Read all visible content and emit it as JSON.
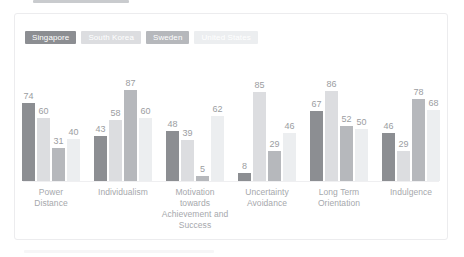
{
  "card": {
    "background_color": "#ffffff",
    "border_color": "#ececee"
  },
  "legend": {
    "position": "top-left",
    "items": [
      {
        "label": "Singapore",
        "color": "#8c8e92"
      },
      {
        "label": "South Korea",
        "color": "#dcdde0"
      },
      {
        "label": "Sweden",
        "color": "#b6b8bc"
      },
      {
        "label": "United States",
        "color": "#eceef0"
      }
    ]
  },
  "axis": {
    "baseline_color": "#efeff1",
    "label_color": "#a6a8ac",
    "value_label_color": "#9b9da1"
  },
  "chart_data": {
    "type": "bar",
    "title": "",
    "subtitle": "",
    "xlabel": "",
    "ylabel": "",
    "ylim": [
      0,
      100
    ],
    "grid": false,
    "legend_position": "top-left",
    "categories": [
      "Power Distance",
      "Individualism",
      "Motivation towards Achievement and Success",
      "Uncertainty Avoidance",
      "Long Term Orientation",
      "Indulgence"
    ],
    "series": [
      {
        "name": "Singapore",
        "color": "#8c8e92",
        "values": [
          74,
          43,
          48,
          8,
          67,
          46
        ]
      },
      {
        "name": "South Korea",
        "color": "#dcdde0",
        "values": [
          60,
          58,
          39,
          85,
          86,
          29
        ]
      },
      {
        "name": "Sweden",
        "color": "#b6b8bc",
        "values": [
          31,
          87,
          5,
          29,
          52,
          78
        ]
      },
      {
        "name": "United States",
        "color": "#eceef0",
        "values": [
          40,
          60,
          62,
          46,
          50,
          68
        ]
      }
    ]
  },
  "groups": [
    {
      "label_lines": [
        "Power",
        "Distance"
      ],
      "bars": [
        {
          "series": "Singapore",
          "value": 74,
          "color": "#8c8e92"
        },
        {
          "series": "South Korea",
          "value": 60,
          "color": "#dcdde0"
        },
        {
          "series": "Sweden",
          "value": 31,
          "color": "#b6b8bc"
        },
        {
          "series": "United States",
          "value": 40,
          "color": "#eceef0"
        }
      ]
    },
    {
      "label_lines": [
        "Individualism"
      ],
      "bars": [
        {
          "series": "Singapore",
          "value": 43,
          "color": "#8c8e92"
        },
        {
          "series": "South Korea",
          "value": 58,
          "color": "#dcdde0"
        },
        {
          "series": "Sweden",
          "value": 87,
          "color": "#b6b8bc"
        },
        {
          "series": "United States",
          "value": 60,
          "color": "#eceef0"
        }
      ]
    },
    {
      "label_lines": [
        "Motivation",
        "towards",
        "Achievement and",
        "Success"
      ],
      "bars": [
        {
          "series": "Singapore",
          "value": 48,
          "color": "#8c8e92"
        },
        {
          "series": "South Korea",
          "value": 39,
          "color": "#dcdde0"
        },
        {
          "series": "Sweden",
          "value": 5,
          "color": "#b6b8bc"
        },
        {
          "series": "United States",
          "value": 62,
          "color": "#eceef0"
        }
      ]
    },
    {
      "label_lines": [
        "Uncertainty",
        "Avoidance"
      ],
      "bars": [
        {
          "series": "Singapore",
          "value": 8,
          "color": "#8c8e92"
        },
        {
          "series": "South Korea",
          "value": 85,
          "color": "#dcdde0"
        },
        {
          "series": "Sweden",
          "value": 29,
          "color": "#b6b8bc"
        },
        {
          "series": "United States",
          "value": 46,
          "color": "#eceef0"
        }
      ]
    },
    {
      "label_lines": [
        "Long Term",
        "Orientation"
      ],
      "bars": [
        {
          "series": "Singapore",
          "value": 67,
          "color": "#8c8e92"
        },
        {
          "series": "South Korea",
          "value": 86,
          "color": "#dcdde0"
        },
        {
          "series": "Sweden",
          "value": 52,
          "color": "#b6b8bc"
        },
        {
          "series": "United States",
          "value": 50,
          "color": "#eceef0"
        }
      ]
    },
    {
      "label_lines": [
        "Indulgence"
      ],
      "bars": [
        {
          "series": "Singapore",
          "value": 46,
          "color": "#8c8e92"
        },
        {
          "series": "South Korea",
          "value": 29,
          "color": "#dcdde0"
        },
        {
          "series": "Sweden",
          "value": 78,
          "color": "#b6b8bc"
        },
        {
          "series": "United States",
          "value": 68,
          "color": "#eceef0"
        }
      ]
    }
  ]
}
